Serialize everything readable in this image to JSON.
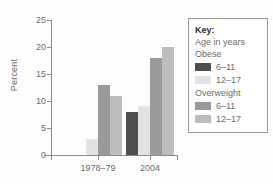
{
  "chart_data": {
    "type": "bar",
    "title": "",
    "xlabel": "",
    "ylabel": "Percent",
    "ylim": [
      0,
      25
    ],
    "ytick_values": [
      0,
      5,
      10,
      15,
      20,
      25
    ],
    "ytick_labels": [
      "0",
      "5",
      "10",
      "15",
      "20",
      "25"
    ],
    "grid": false,
    "categories": [
      "1978–79",
      "2004"
    ],
    "series": [
      {
        "name": "Obese 6–11",
        "values": [
          0,
          8
        ],
        "color": "#4f4f4f"
      },
      {
        "name": "Obese 12–17",
        "values": [
          3,
          9
        ],
        "color": "#e2e2e2"
      },
      {
        "name": "Overweight 6–11",
        "values": [
          13,
          18
        ],
        "color": "#9a9a9a"
      },
      {
        "name": "Overweight 12–17",
        "values": [
          11,
          20
        ],
        "color": "#bdbdbd"
      }
    ],
    "legend_position": "right"
  },
  "legend": {
    "title": "Key:",
    "subtitle": "Age in years",
    "groups": [
      {
        "heading": "Obese",
        "entries": [
          {
            "label": "6–11",
            "color": "#4f4f4f"
          },
          {
            "label": "12–17",
            "color": "#e2e2e2"
          }
        ]
      },
      {
        "heading": "Overweight",
        "entries": [
          {
            "label": "6–11",
            "color": "#9a9a9a"
          },
          {
            "label": "12–17",
            "color": "#bdbdbd"
          }
        ]
      }
    ]
  },
  "axes": {
    "y_title": "Percent",
    "x_labels": [
      "1978–79",
      "2004"
    ]
  },
  "colors": {
    "axis": "#8a8a8a",
    "text": "#6b6b6b",
    "legend_border": "#9a9a9a",
    "background": "#fdfdfd"
  }
}
